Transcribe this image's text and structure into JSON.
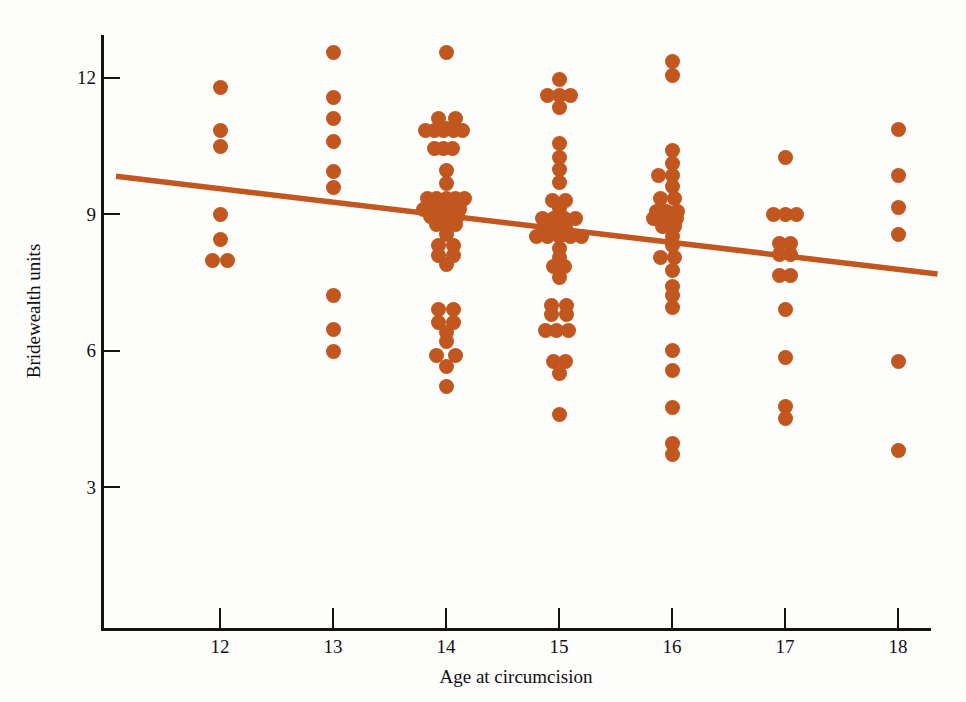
{
  "chart_data": {
    "type": "scatter",
    "title": "",
    "xlabel": "Age at circumcision",
    "ylabel": "Bridewealth units",
    "xlim": [
      11.05,
      18.3
    ],
    "ylim": [
      0.1,
      13.4
    ],
    "xticks": [
      12,
      13,
      14,
      15,
      16,
      17,
      18
    ],
    "xtick_labels": [
      "12",
      "13",
      "14",
      "15",
      "16",
      "17",
      "18"
    ],
    "yticks": [
      3,
      6,
      9,
      12
    ],
    "ytick_labels": [
      "3",
      "6",
      "9",
      "12"
    ],
    "grid": false,
    "legend": null,
    "marker_color": "#c1561f",
    "trendline_color": "#c1561f",
    "trendline": {
      "x_start": 11.08,
      "y_start": 9.83,
      "x_end": 18.35,
      "y_end": 7.68,
      "slope": -0.296,
      "intercept": 13.11
    },
    "series": [
      {
        "name": "Bridewealth by age at circumcision",
        "points": [
          [
            12.0,
            11.78
          ],
          [
            12.0,
            10.83
          ],
          [
            12.0,
            10.48
          ],
          [
            12.0,
            9.0
          ],
          [
            12.0,
            8.45
          ],
          [
            11.93,
            7.97
          ],
          [
            12.07,
            7.97
          ],
          [
            13.0,
            12.55
          ],
          [
            13.0,
            11.55
          ],
          [
            13.0,
            11.1
          ],
          [
            13.0,
            10.6
          ],
          [
            13.0,
            9.93
          ],
          [
            13.0,
            9.58
          ],
          [
            13.0,
            7.2
          ],
          [
            13.0,
            6.47
          ],
          [
            13.0,
            5.97
          ],
          [
            14.0,
            12.55
          ],
          [
            13.93,
            11.1
          ],
          [
            14.08,
            11.1
          ],
          [
            14.0,
            10.88
          ],
          [
            13.82,
            10.83
          ],
          [
            13.9,
            10.83
          ],
          [
            13.98,
            10.83
          ],
          [
            14.07,
            10.83
          ],
          [
            14.15,
            10.83
          ],
          [
            13.9,
            10.45
          ],
          [
            13.98,
            10.45
          ],
          [
            14.06,
            10.45
          ],
          [
            14.0,
            9.95
          ],
          [
            14.0,
            9.66
          ],
          [
            13.84,
            9.35
          ],
          [
            13.92,
            9.35
          ],
          [
            14.0,
            9.35
          ],
          [
            14.08,
            9.35
          ],
          [
            14.16,
            9.35
          ],
          [
            13.88,
            9.2
          ],
          [
            13.96,
            9.2
          ],
          [
            14.04,
            9.2
          ],
          [
            14.12,
            9.2
          ],
          [
            13.8,
            9.1
          ],
          [
            13.88,
            9.1
          ],
          [
            13.96,
            9.1
          ],
          [
            14.04,
            9.1
          ],
          [
            14.12,
            9.1
          ],
          [
            13.86,
            8.95
          ],
          [
            13.94,
            8.95
          ],
          [
            14.02,
            8.95
          ],
          [
            14.1,
            8.95
          ],
          [
            13.92,
            8.78
          ],
          [
            14.0,
            8.78
          ],
          [
            14.08,
            8.78
          ],
          [
            14.0,
            8.55
          ],
          [
            13.93,
            8.3
          ],
          [
            14.07,
            8.3
          ],
          [
            13.93,
            8.08
          ],
          [
            14.07,
            8.08
          ],
          [
            14.0,
            7.9
          ],
          [
            13.93,
            6.9
          ],
          [
            14.07,
            6.9
          ],
          [
            13.93,
            6.62
          ],
          [
            14.07,
            6.62
          ],
          [
            14.0,
            6.4
          ],
          [
            14.0,
            6.2
          ],
          [
            13.92,
            5.88
          ],
          [
            14.08,
            5.88
          ],
          [
            14.0,
            5.65
          ],
          [
            14.0,
            5.2
          ],
          [
            15.0,
            11.95
          ],
          [
            14.9,
            11.6
          ],
          [
            15.0,
            11.6
          ],
          [
            15.1,
            11.6
          ],
          [
            15.0,
            11.35
          ],
          [
            15.0,
            10.55
          ],
          [
            15.0,
            10.25
          ],
          [
            15.0,
            9.98
          ],
          [
            15.0,
            9.7
          ],
          [
            14.94,
            9.3
          ],
          [
            15.06,
            9.3
          ],
          [
            15.0,
            9.12
          ],
          [
            14.85,
            8.9
          ],
          [
            14.95,
            8.9
          ],
          [
            15.05,
            8.9
          ],
          [
            15.15,
            8.9
          ],
          [
            14.88,
            8.7
          ],
          [
            14.97,
            8.7
          ],
          [
            15.06,
            8.7
          ],
          [
            14.8,
            8.5
          ],
          [
            14.9,
            8.5
          ],
          [
            15.0,
            8.5
          ],
          [
            15.1,
            8.5
          ],
          [
            15.2,
            8.5
          ],
          [
            15.0,
            8.25
          ],
          [
            15.0,
            8.05
          ],
          [
            14.95,
            7.85
          ],
          [
            15.05,
            7.85
          ],
          [
            15.0,
            7.6
          ],
          [
            14.93,
            7.0
          ],
          [
            15.07,
            7.0
          ],
          [
            14.93,
            6.8
          ],
          [
            15.07,
            6.8
          ],
          [
            14.88,
            6.45
          ],
          [
            14.98,
            6.45
          ],
          [
            15.08,
            6.45
          ],
          [
            14.95,
            5.75
          ],
          [
            15.06,
            5.75
          ],
          [
            15.0,
            5.5
          ],
          [
            15.0,
            4.6
          ],
          [
            16.0,
            12.35
          ],
          [
            16.0,
            12.05
          ],
          [
            16.0,
            10.4
          ],
          [
            16.0,
            10.1
          ],
          [
            15.88,
            9.85
          ],
          [
            16.0,
            9.85
          ],
          [
            16.0,
            9.6
          ],
          [
            15.9,
            9.35
          ],
          [
            16.02,
            9.35
          ],
          [
            15.86,
            9.05
          ],
          [
            15.95,
            9.05
          ],
          [
            16.05,
            9.05
          ],
          [
            15.84,
            8.9
          ],
          [
            15.94,
            8.9
          ],
          [
            16.04,
            8.9
          ],
          [
            15.92,
            8.72
          ],
          [
            16.02,
            8.72
          ],
          [
            16.0,
            8.5
          ],
          [
            16.0,
            8.3
          ],
          [
            15.9,
            8.05
          ],
          [
            16.02,
            8.05
          ],
          [
            16.0,
            7.75
          ],
          [
            16.0,
            7.4
          ],
          [
            16.0,
            7.2
          ],
          [
            16.0,
            6.95
          ],
          [
            16.0,
            6.0
          ],
          [
            16.0,
            5.55
          ],
          [
            16.0,
            4.75
          ],
          [
            16.0,
            3.95
          ],
          [
            16.0,
            3.72
          ],
          [
            17.0,
            10.25
          ],
          [
            16.9,
            9.0
          ],
          [
            17.0,
            9.0
          ],
          [
            17.1,
            9.0
          ],
          [
            16.95,
            8.35
          ],
          [
            17.05,
            8.35
          ],
          [
            16.95,
            8.12
          ],
          [
            17.05,
            8.12
          ],
          [
            16.95,
            7.65
          ],
          [
            17.05,
            7.65
          ],
          [
            17.0,
            6.9
          ],
          [
            17.0,
            5.85
          ],
          [
            17.0,
            4.78
          ],
          [
            17.0,
            4.5
          ],
          [
            18.0,
            10.85
          ],
          [
            18.0,
            9.85
          ],
          [
            18.0,
            9.15
          ],
          [
            18.0,
            8.55
          ],
          [
            18.0,
            5.75
          ],
          [
            18.0,
            3.8
          ]
        ]
      }
    ]
  },
  "axes": {
    "y_title": "Bridewealth units",
    "x_title": "Age at circumcision"
  }
}
